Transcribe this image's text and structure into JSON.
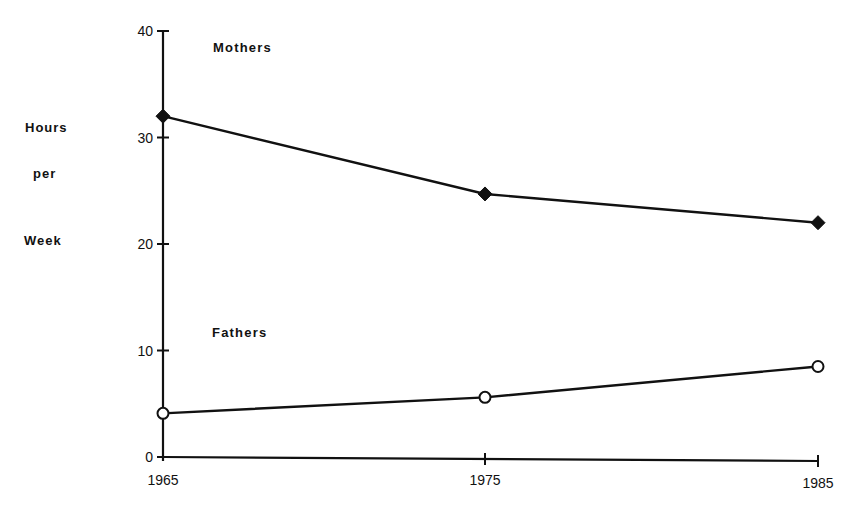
{
  "chart_data": {
    "type": "line",
    "title": "",
    "xlabel": "",
    "ylabel": "Hours per Week",
    "ylabel_lines": [
      "Hours",
      "per",
      "Week"
    ],
    "x": [
      1965,
      1975,
      1985
    ],
    "x_tick_labels": [
      "1965",
      "1975",
      "1985"
    ],
    "y_ticks": [
      0,
      10,
      20,
      30,
      40
    ],
    "y_tick_labels": [
      "0",
      "10",
      "20",
      "30",
      "40"
    ],
    "ylim": [
      0,
      40
    ],
    "grid": false,
    "legend": "inline labels",
    "series": [
      {
        "name": "Mothers",
        "marker": "filled-diamond",
        "values": [
          32,
          24.7,
          22
        ]
      },
      {
        "name": "Fathers",
        "marker": "open-circle",
        "values": [
          4.1,
          5.6,
          8.5
        ]
      }
    ]
  },
  "labels": {
    "ylabel_1": "Hours",
    "ylabel_2": "per",
    "ylabel_3": "Week",
    "mothers": "Mothers",
    "fathers": "Fathers"
  }
}
